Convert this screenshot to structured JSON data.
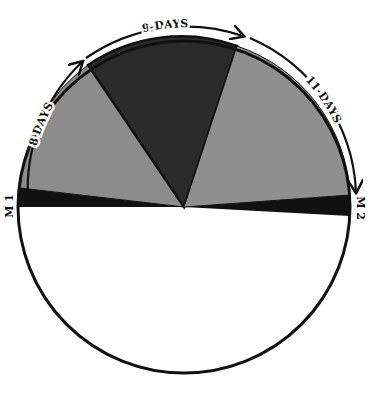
{
  "diagram": {
    "segments": [
      {
        "id": "seg-left",
        "label": "8 DAYS",
        "fill": "#8c8c8c"
      },
      {
        "id": "seg-top",
        "label": "9-DAYS",
        "fill": "#2b2b2b"
      },
      {
        "id": "seg-right",
        "label": "11-DAYS",
        "fill": "#8f8f8f"
      }
    ],
    "bands": [
      {
        "id": "band-left",
        "fill": "#111111"
      },
      {
        "id": "band-right",
        "fill": "#111111"
      }
    ],
    "endpoints": {
      "left": "M 1",
      "right": "M 2"
    },
    "colors": {
      "outline": "#111111",
      "background": "#ffffff",
      "lower_half": "#ffffff"
    }
  }
}
